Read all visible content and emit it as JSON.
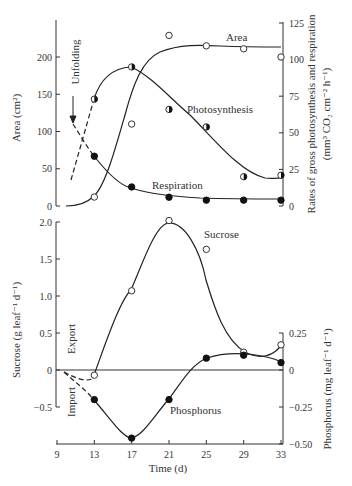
{
  "chart_data": [
    {
      "type": "line",
      "panel": "top",
      "title": "",
      "xlabel": "",
      "x": [
        13,
        17,
        21,
        25,
        29,
        33
      ],
      "xlim": [
        9,
        33
      ],
      "ylabel": "Area (cm²)",
      "ylim": [
        0,
        250
      ],
      "yticks": [
        0,
        50,
        100,
        150,
        200
      ],
      "y2label": "Rates of gross photosynthesis and respiration (mm³ CO₂ cm⁻² h⁻¹)",
      "y2lim": [
        0,
        125
      ],
      "y2ticks": [
        0,
        25,
        50,
        75,
        100,
        125
      ],
      "grid": false,
      "series": [
        {
          "name": "Area",
          "axis": "left",
          "marker": "open-circle",
          "values": [
            12,
            110,
            229,
            215,
            211,
            200
          ]
        },
        {
          "name": "Photosynthesis",
          "axis": "right",
          "marker": "half-filled-circle",
          "values": [
            73,
            95,
            66,
            54,
            20,
            21
          ]
        },
        {
          "name": "Respiration",
          "axis": "right",
          "marker": "filled-circle",
          "values": [
            34,
            13,
            6,
            4,
            4,
            4
          ]
        }
      ],
      "annotations": [
        {
          "text": "Unfolding",
          "x": 10,
          "note": "arrow pointing down at day 10; dashed extrapolations of photosynthesis and respiration before day 13"
        },
        {
          "text": "Area"
        },
        {
          "text": "Photosynthesis"
        },
        {
          "text": "Respiration"
        }
      ]
    },
    {
      "type": "line",
      "panel": "bottom",
      "title": "",
      "xlabel": "Time (d)",
      "x": [
        13,
        17,
        21,
        25,
        29,
        33
      ],
      "xticks": [
        9,
        13,
        17,
        21,
        25,
        29,
        33
      ],
      "xlim": [
        9,
        33
      ],
      "ylabel": "Sucrose (g leaf⁻¹ d⁻¹)",
      "ylim": [
        -0.5,
        2.0
      ],
      "yticks": [
        -0.5,
        0,
        0.5,
        1.0,
        1.5,
        2.0
      ],
      "y2label": "Phosphorus (mg leaf⁻¹ d⁻¹)",
      "y2lim": [
        -0.5,
        0.25
      ],
      "y2ticks": [
        -0.5,
        -0.25,
        0,
        0.25
      ],
      "grid": false,
      "series": [
        {
          "name": "Sucrose",
          "axis": "left",
          "marker": "open-circle",
          "values": [
            -0.07,
            1.07,
            2.02,
            1.63,
            0.24,
            0.34
          ]
        },
        {
          "name": "Phosphorus",
          "axis": "right",
          "marker": "filled-circle",
          "values": [
            -0.2,
            -0.46,
            -0.2,
            0.08,
            0.1,
            0.05
          ]
        }
      ],
      "annotations": [
        {
          "text": "Export",
          "note": "above zero line"
        },
        {
          "text": "Import",
          "note": "below zero line"
        },
        {
          "text": "Sucrose"
        },
        {
          "text": "Phosphorus"
        }
      ]
    }
  ],
  "labels": {
    "top_ylabel": "Area (cm²)",
    "top_y2label_1": "Rates of gross photosynthesis and respiration",
    "top_y2label_2": "(mm³ CO₂ cm⁻² h⁻¹)",
    "bottom_ylabel": "Sucrose (g leaf⁻¹ d⁻¹)",
    "bottom_y2label": "Phosphorus (mg leaf⁻¹ d⁻¹)",
    "xlabel": "Time (d)",
    "unfolding": "Unfolding",
    "area": "Area",
    "photosynthesis": "Photosynthesis",
    "respiration": "Respiration",
    "sucrose": "Sucrose",
    "phosphorus": "Phosphorus",
    "export": "Export",
    "import": "Import"
  }
}
